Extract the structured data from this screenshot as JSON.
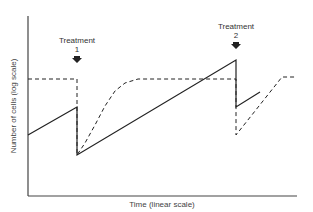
{
  "chart_data": {
    "type": "line",
    "title": "",
    "xlabel": "Time (linear scale)",
    "ylabel": "Number of cells (log scale)",
    "grid": false,
    "legend": null,
    "annotations": [
      {
        "text_line1": "Treatment",
        "text_line2": "1",
        "x_px": 77,
        "marker": "downward-arrow"
      },
      {
        "text_line1": "Treatment",
        "text_line2": "2",
        "x_px": 236,
        "marker": "downward-arrow"
      }
    ],
    "series": [
      {
        "name": "solid",
        "style": "solid",
        "points_px": [
          [
            28,
            135
          ],
          [
            77,
            107
          ],
          [
            77,
            155
          ],
          [
            236,
            60
          ],
          [
            236,
            107
          ],
          [
            260,
            92
          ]
        ]
      },
      {
        "name": "dashed",
        "style": "dashed",
        "points_px": [
          [
            28,
            79
          ],
          [
            77,
            79
          ],
          [
            77,
            155
          ],
          [
            85,
            143
          ],
          [
            95,
            125
          ],
          [
            105,
            106
          ],
          [
            115,
            91
          ],
          [
            125,
            83
          ],
          [
            138,
            79
          ],
          [
            236,
            79
          ],
          [
            236,
            135
          ],
          [
            282,
            77
          ],
          [
            297,
            77
          ]
        ]
      }
    ],
    "axes": {
      "x": {
        "start_px": 28,
        "end_px": 297,
        "y_px": 196
      },
      "y": {
        "x_px": 28,
        "top_px": 16,
        "bottom_px": 196
      }
    }
  },
  "labels": {
    "treatment1_line1": "Treatment",
    "treatment1_line2": "1",
    "treatment2_line1": "Treatment",
    "treatment2_line2": "2",
    "xlabel": "Time (linear scale)",
    "ylabel": "Number of cells (log scale)"
  },
  "colors": {
    "line": "#222222",
    "axis": "#333333",
    "text": "#333333"
  }
}
